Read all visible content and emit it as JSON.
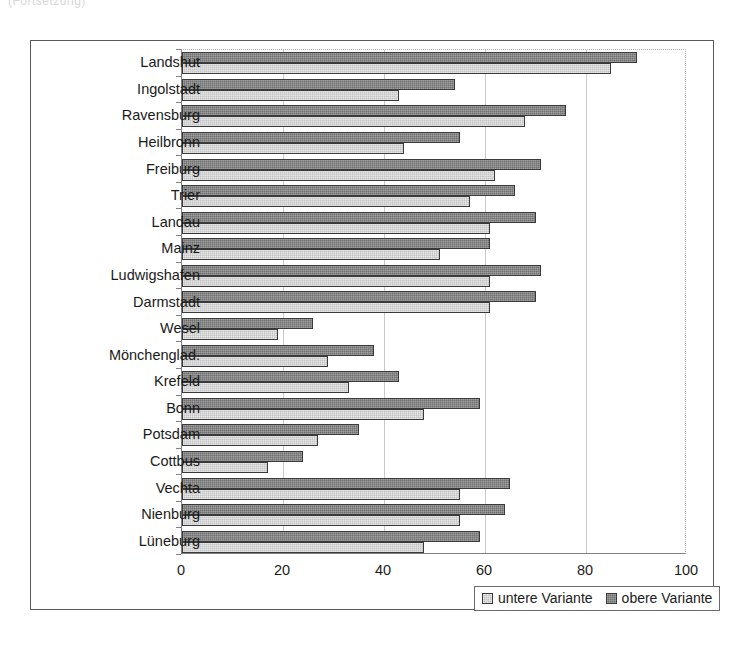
{
  "top_caption": "(Fortsetzung)",
  "chart_data": {
    "type": "bar",
    "orientation": "horizontal",
    "title": "",
    "subtitle": "",
    "xlabel": "",
    "ylabel": "",
    "xlim": [
      0,
      100
    ],
    "xticks": [
      0,
      20,
      40,
      60,
      80,
      100
    ],
    "xtick_labels": [
      "0",
      "20",
      "40",
      "60",
      "80",
      "100"
    ],
    "grid": true,
    "legend_position": "bottom-right",
    "categories": [
      "Landshut",
      "Ingolstadt",
      "Ravensburg",
      "Heilbronn",
      "Freiburg",
      "Trier",
      "Landau",
      "Mainz",
      "Ludwigshafen",
      "Darmstadt",
      "Wesel",
      "Mönchenglad.",
      "Krefeld",
      "Bonn",
      "Potsdam",
      "Cottbus",
      "Vechta",
      "Nienburg",
      "Lüneburg"
    ],
    "series": [
      {
        "name": "obere Variante",
        "color": "#6f6f6f",
        "values": [
          90,
          54,
          76,
          55,
          71,
          66,
          70,
          61,
          71,
          70,
          26,
          38,
          43,
          59,
          35,
          24,
          65,
          64,
          59
        ]
      },
      {
        "name": "untere Variante",
        "color": "#c2c2c2",
        "values": [
          85,
          43,
          68,
          44,
          62,
          57,
          61,
          51,
          61,
          61,
          19,
          29,
          33,
          48,
          27,
          17,
          55,
          55,
          48
        ]
      }
    ]
  },
  "legend": {
    "entries": [
      {
        "label": "untere Variante",
        "key": "untere"
      },
      {
        "label": "obere Variante",
        "key": "obere"
      }
    ]
  }
}
